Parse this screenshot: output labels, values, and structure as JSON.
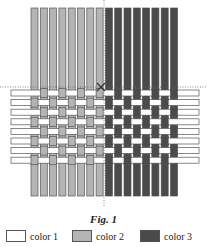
{
  "figure": {
    "caption": "Fig. 1",
    "colors": {
      "color1": "#ffffff",
      "color2": "#b4b4b4",
      "color3": "#4a4a4a",
      "outline": "#555555"
    },
    "vertical_strips": {
      "count": 16,
      "x_start": 31,
      "spacing": 9.3,
      "width": 7,
      "y_top": 8,
      "y_bottom": 196,
      "color_groups": [
        "color2",
        "color2",
        "color2",
        "color2",
        "color2",
        "color2",
        "color2",
        "color2",
        "color3",
        "color3",
        "color3",
        "color3",
        "color3",
        "color3",
        "color3",
        "color3"
      ]
    },
    "horizontal_strips": {
      "count": 8,
      "y_start": 90,
      "spacing": 9.6,
      "height": 6,
      "x_left": 11,
      "x_right": 199,
      "color": "color1"
    },
    "guides": {
      "vertical_dotted_x": 104,
      "horizontal_dotted_y": 87,
      "cross_marker": {
        "x": 101,
        "y": 87
      }
    }
  },
  "legend": [
    {
      "label": "color 1",
      "color": "#ffffff"
    },
    {
      "label": "color 2",
      "color": "#b4b4b4"
    },
    {
      "label": "color 3",
      "color": "#4a4a4a"
    }
  ]
}
